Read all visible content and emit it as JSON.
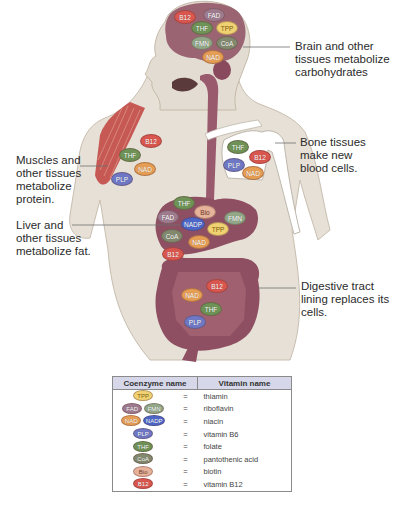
{
  "annotations": {
    "brain": "Brain and other tissues metabolize carbohydrates",
    "bone": "Bone tissues make new blood cells.",
    "muscle": "Muscles and other tissues metabolize protein.",
    "liver": "Liver and other tissues metabolize fat.",
    "digestive": "Digestive tract lining replaces its cells."
  },
  "annotation_lines": {
    "brain": [
      "Brain and other",
      "tissues metabolize",
      "carbohydrates"
    ],
    "bone": [
      "Bone tissues",
      "make new",
      "blood cells."
    ],
    "muscle": [
      "Muscles and",
      "other tissues",
      "metabolize",
      "protein."
    ],
    "liver": [
      "Liver and",
      "other tissues",
      "metabolize fat."
    ],
    "digestive": [
      "Digestive tract",
      "lining replaces its",
      "cells."
    ]
  },
  "regions": {
    "brain": [
      "B12",
      "FAD",
      "THF",
      "TPP",
      "FMN",
      "CoA",
      "NAD"
    ],
    "muscle": [
      "B12",
      "THF",
      "NAD",
      "PLP"
    ],
    "bone": [
      "THF",
      "B12",
      "PLP",
      "NAD"
    ],
    "liver": [
      "THF",
      "Bio",
      "FAD",
      "NADP",
      "FMN",
      "TPP",
      "CoA",
      "NAD",
      "B12"
    ],
    "digestive": [
      "B12",
      "NAD",
      "THF",
      "PLP"
    ]
  },
  "colors": {
    "B12": "#d9574f",
    "FAD": "#9e7b8e",
    "THF": "#6f9257",
    "TPP": "#f0d273",
    "FMN": "#93a789",
    "CoA": "#83896f",
    "NAD": "#e69e55",
    "PLP": "#6f78c4",
    "NADP": "#4d67c9",
    "Bio": "#e6b29a",
    "organ": "#8e4f63",
    "skin": "#e3dcd2",
    "table_header": "#d6d8ea"
  },
  "legend": {
    "headers": [
      "Coenzyme name",
      "Vitamin name"
    ],
    "equals": "=",
    "rows": [
      {
        "coenzymes": [
          "TPP"
        ],
        "vitamin": "thiamin"
      },
      {
        "coenzymes": [
          "FAD",
          "FMN"
        ],
        "vitamin": "riboflavin"
      },
      {
        "coenzymes": [
          "NAD",
          "NADP"
        ],
        "vitamin": "niacin"
      },
      {
        "coenzymes": [
          "PLP"
        ],
        "vitamin": "vitamin B6"
      },
      {
        "coenzymes": [
          "THF"
        ],
        "vitamin": "folate"
      },
      {
        "coenzymes": [
          "CoA"
        ],
        "vitamin": "pantothenic acid"
      },
      {
        "coenzymes": [
          "Bio"
        ],
        "vitamin": "biotin"
      },
      {
        "coenzymes": [
          "B12"
        ],
        "vitamin": "vitamin B12"
      }
    ]
  }
}
